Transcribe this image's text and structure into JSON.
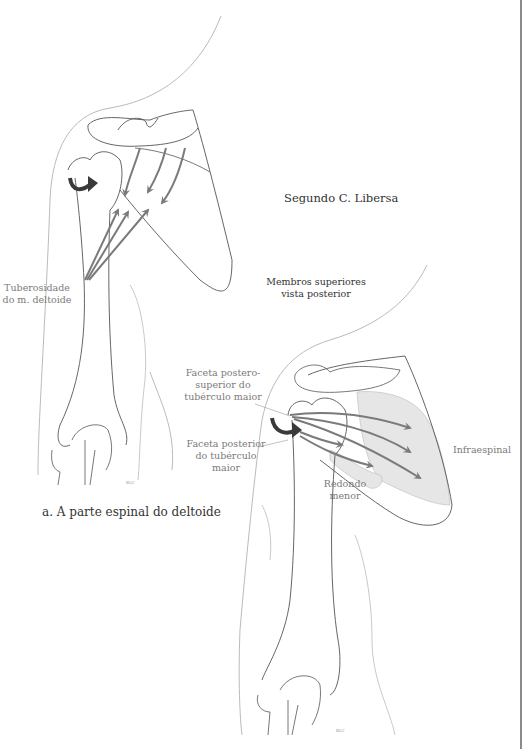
{
  "author": "Segundo C. Libersa",
  "subtitle": "Membros superiores\nvista posterior",
  "figure_a": {
    "caption": "a. A parte espinal do deltoide",
    "labels": {
      "tuberosity": "Tuberosidade\ndo m. deltoide"
    },
    "signature": "BLC"
  },
  "figure_b": {
    "labels": {
      "posterosuperior_facet": "Faceta postero-\nsuperior do\ntubérculo maior",
      "posterior_facet": "Faceta posterior\ndo tubérculo maior",
      "teres_minor": "Redondo\nmenor",
      "infraspinatus": "Infraespinal"
    },
    "signature": "BLC"
  },
  "colors": {
    "outline": "#555555",
    "skin_outline": "#bbbbbb",
    "arrow": "#7a7a7a",
    "arrow_dark": "#3a3a3a",
    "muscle_fill": "#e6e6e6"
  }
}
